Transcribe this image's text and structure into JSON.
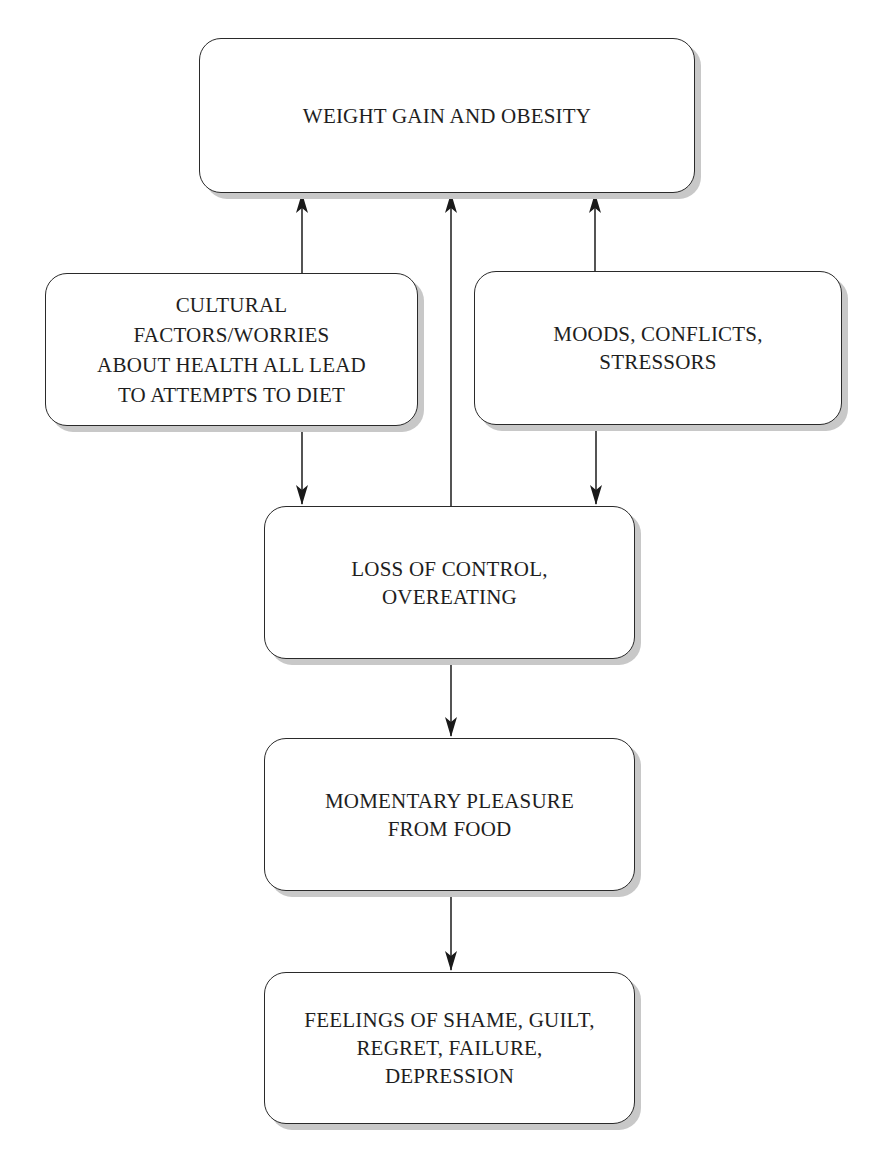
{
  "diagram": {
    "type": "flowchart",
    "nodes": [
      {
        "id": "weight",
        "label": "WEIGHT GAIN AND OBESITY"
      },
      {
        "id": "cultural",
        "label": "CULTURAL\nFACTORS/WORRIES\nABOUT HEALTH ALL LEAD\nTO ATTEMPTS TO DIET"
      },
      {
        "id": "moods",
        "label": "MOODS, CONFLICTS,\nSTRESSORS"
      },
      {
        "id": "loss",
        "label": "LOSS OF CONTROL,\nOVEREATING"
      },
      {
        "id": "pleasure",
        "label": "MOMENTARY PLEASURE\nFROM FOOD"
      },
      {
        "id": "feelings",
        "label": "FEELINGS OF SHAME, GUILT,\nREGRET, FAILURE,\nDEPRESSION"
      }
    ],
    "edges": [
      {
        "from": "cultural",
        "to": "weight"
      },
      {
        "from": "loss",
        "to": "weight"
      },
      {
        "from": "moods",
        "to": "weight"
      },
      {
        "from": "cultural",
        "to": "loss"
      },
      {
        "from": "moods",
        "to": "loss"
      },
      {
        "from": "loss",
        "to": "pleasure"
      },
      {
        "from": "pleasure",
        "to": "feelings"
      }
    ],
    "colors": {
      "stroke": "#2a2a2a",
      "shadow": "#c8c8c8",
      "text": "#1e1e1e",
      "background": "#ffffff"
    }
  }
}
